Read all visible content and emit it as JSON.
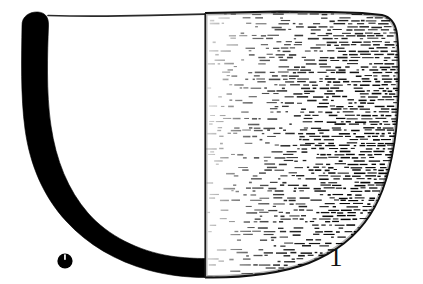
{
  "figure": {
    "type": "archaeological-vessel-profile-drawing",
    "catalog_number": "1",
    "scale_marker_label": "",
    "background_color": "#ffffff",
    "ink_color": "#000000",
    "section_fill_color": "#000000",
    "outline_color": "#1a1a1a",
    "hatch_color": "#000000",
    "canvas": {
      "width": 423,
      "height": 284
    },
    "parts": {
      "left_half_label": "section",
      "right_half_label": "exterior",
      "center_axis_label": "axis",
      "rim_label": "rim",
      "base_label": "base",
      "dot_marker_label": "scale-dot"
    }
  },
  "chart_data": {
    "type": "line",
    "title": "",
    "xlabel": "",
    "ylabel": "",
    "axis_x_px": 205,
    "rim_y_px": 15,
    "base_y_px": 277,
    "vessel_left_px": 21,
    "vessel_right_px": 399,
    "rim_radius_px": 184,
    "max_height_px": 262,
    "series": [
      {
        "name": "inner-wall-profile",
        "points": [
          [
            48,
            16
          ],
          [
            44,
            50
          ],
          [
            46,
            95
          ],
          [
            55,
            140
          ],
          [
            74,
            184
          ],
          [
            104,
            219
          ],
          [
            142,
            243
          ],
          [
            180,
            253
          ],
          [
            205,
            255
          ]
        ]
      },
      {
        "name": "outer-wall-profile",
        "points": [
          [
            22,
            18
          ],
          [
            21,
            60
          ],
          [
            24,
            108
          ],
          [
            36,
            155
          ],
          [
            60,
            199
          ],
          [
            96,
            237
          ],
          [
            142,
            262
          ],
          [
            180,
            272
          ],
          [
            205,
            277
          ]
        ]
      },
      {
        "name": "exterior-outline-right",
        "points": [
          [
            205,
            13
          ],
          [
            280,
            12
          ],
          [
            350,
            13
          ],
          [
            386,
            17
          ],
          [
            396,
            35
          ],
          [
            399,
            80
          ],
          [
            396,
            130
          ],
          [
            384,
            180
          ],
          [
            360,
            222
          ],
          [
            325,
            252
          ],
          [
            278,
            270
          ],
          [
            235,
            276
          ],
          [
            205,
            277
          ]
        ]
      },
      {
        "name": "rim-line-left",
        "points": [
          [
            48,
            15
          ],
          [
            120,
            16
          ],
          [
            170,
            15
          ],
          [
            205,
            14
          ]
        ]
      }
    ],
    "markers": [
      {
        "name": "scale-dot",
        "cx": 65,
        "cy": 261,
        "r": 7.5,
        "fill": "#000000"
      }
    ],
    "annotations": [
      {
        "name": "catalog-number",
        "text": "1",
        "x": 338,
        "y": 259
      }
    ]
  }
}
